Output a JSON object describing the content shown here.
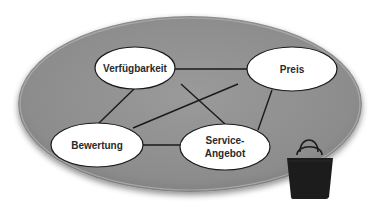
{
  "diagram": {
    "type": "network",
    "container": {
      "shape": "ellipse",
      "fill": "#8e8e8e",
      "cx": 190,
      "cy": 104,
      "rx": 172,
      "ry": 88
    },
    "nodes": [
      {
        "id": "verfuegbarkeit",
        "label": "Verfügbarkeit",
        "cx": 135,
        "cy": 68,
        "rx": 40,
        "ry": 21
      },
      {
        "id": "preis",
        "label": "Preis",
        "cx": 292,
        "cy": 69,
        "rx": 45,
        "ry": 22
      },
      {
        "id": "bewertung",
        "label": "Bewertung",
        "cx": 97,
        "cy": 145,
        "rx": 46,
        "ry": 22
      },
      {
        "id": "service",
        "label_line1": "Service-",
        "label_line2": "Angebot",
        "cx": 225,
        "cy": 147,
        "rx": 45,
        "ry": 23
      }
    ],
    "edges": [
      {
        "from": "verfuegbarkeit",
        "to": "preis"
      },
      {
        "from": "verfuegbarkeit",
        "to": "bewertung"
      },
      {
        "from": "verfuegbarkeit",
        "to": "service"
      },
      {
        "from": "preis",
        "to": "bewertung"
      },
      {
        "from": "preis",
        "to": "service"
      },
      {
        "from": "bewertung",
        "to": "service"
      }
    ],
    "icon": "shopping-bag-icon",
    "colors": {
      "container": "#8e8e8e",
      "node_fill": "#ffffff",
      "stroke": "#1a1a1a",
      "bag": "#1c1c1c"
    }
  }
}
